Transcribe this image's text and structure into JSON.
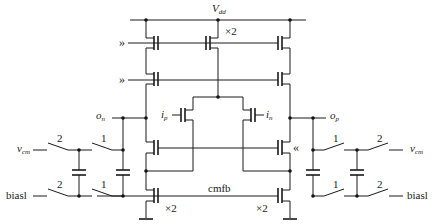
{
  "diagram": {
    "type": "circuit-schematic",
    "labels": {
      "vdd": "V",
      "vdd_sub": "dd",
      "x2_top": "×2",
      "on": "o",
      "on_sub": "n",
      "op": "o",
      "op_sub": "p",
      "ip": "i",
      "ip_sub": "p",
      "in": "i",
      "in_sub": "n",
      "vcm_left": "v",
      "vcm_left_sub": "cm",
      "vcm_right": "v",
      "vcm_right_sub": "cm",
      "bias_left": "biasl",
      "bias_right": "biasl",
      "cmfb": "cmfb",
      "x2_bottom_left": "×2",
      "x2_bottom_right": "×2",
      "bias_arrow_1": "»",
      "bias_arrow_2": "»",
      "bias_arrow_3": "«"
    },
    "switch_phases": {
      "left_outer_top": "2",
      "left_inner_top": "1",
      "left_outer_bottom": "2",
      "left_inner_bottom": "1",
      "right_inner_top": "1",
      "right_outer_top": "2",
      "right_inner_bottom": "1",
      "right_outer_bottom": "2"
    },
    "components": {
      "pmos_current_sources": 3,
      "pmos_cascodes": 2,
      "pmos_input_pair": 2,
      "nmos_cascodes": 2,
      "nmos_current_sinks": 2,
      "capacitors": 4,
      "switches": 8
    },
    "colors": {
      "line": "#1a1a1a",
      "background": "#ffffff"
    }
  }
}
